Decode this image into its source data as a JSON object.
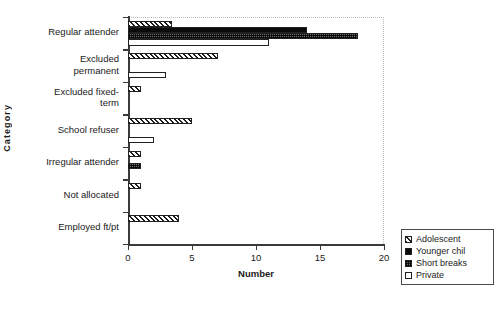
{
  "chart_data": {
    "type": "bar",
    "orientation": "horizontal",
    "title": "",
    "xlabel": "Number",
    "ylabel": "Category",
    "xlim": [
      0,
      20
    ],
    "xticks": [
      0,
      5,
      10,
      15,
      20
    ],
    "grid": false,
    "legend_position": "right-bottom-outside",
    "categories": [
      "Regular attender",
      "Excluded\npermanent",
      "Excluded fixed-\nterm",
      "School refuser",
      "Irregular attender",
      "Not allocated",
      "Employed ft/pt"
    ],
    "series": [
      {
        "name": "Adolescent",
        "pattern": "diagonal-hatch",
        "color": "#ffffff",
        "values": [
          3.4,
          7,
          1,
          5,
          1,
          1,
          4
        ]
      },
      {
        "name": "Younger chil",
        "pattern": "solid",
        "color": "#0a0a0a",
        "values": [
          14,
          0,
          0,
          0,
          0,
          0,
          0
        ]
      },
      {
        "name": "Short breaks",
        "pattern": "checker",
        "color": "#6e6e6e",
        "values": [
          18,
          0,
          0,
          0,
          1,
          0,
          0
        ]
      },
      {
        "name": "Private",
        "pattern": "empty",
        "color": "#ffffff",
        "values": [
          11,
          3,
          0,
          2,
          0,
          0,
          0
        ]
      }
    ]
  },
  "axes": {
    "x_title": "Number",
    "y_title": "Category",
    "x_tick_labels": [
      "0",
      "5",
      "10",
      "15",
      "20"
    ]
  },
  "legend": {
    "items": [
      {
        "label": "Adolescent"
      },
      {
        "label": "Younger chil"
      },
      {
        "label": "Short breaks"
      },
      {
        "label": "Private"
      }
    ]
  }
}
